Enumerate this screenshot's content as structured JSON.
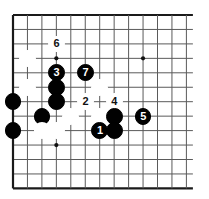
{
  "figure": {
    "kind": "go-board-diagram",
    "width": 209,
    "height": 199,
    "background_color": "#ffffff"
  },
  "board": {
    "columns": 13,
    "rows": 13,
    "origin_x": 13,
    "origin_y": 15,
    "spacing": 14.45,
    "line_color": "#5a5a5a",
    "edge_color": "#1a1a1a",
    "line_width": 1,
    "edge_width": 2.2,
    "star_point_color": "#111111",
    "star_point_radius": 2.1,
    "star_points": [
      {
        "col": 3,
        "row": 3
      },
      {
        "col": 9,
        "row": 3
      },
      {
        "col": 3,
        "row": 9
      }
    ]
  },
  "stones": {
    "radius": 8.4,
    "black_color": "#010101",
    "white_color": "#ffffff",
    "white_border_color": "#3a3a3a",
    "black_label_color": "#ffffff",
    "white_label_color": "#111111",
    "list": [
      {
        "id": "w-a",
        "color": "white",
        "col": 1,
        "row": 3,
        "label": ""
      },
      {
        "id": "w-move-6",
        "color": "white",
        "col": 3,
        "row": 2,
        "label": "6"
      },
      {
        "id": "b-move-3",
        "color": "black",
        "col": 3,
        "row": 4,
        "label": "3"
      },
      {
        "id": "b-move-7",
        "color": "black",
        "col": 5,
        "row": 4,
        "label": "7"
      },
      {
        "id": "w-b",
        "color": "white",
        "col": 1,
        "row": 5,
        "label": ""
      },
      {
        "id": "b-c",
        "color": "black",
        "col": 3,
        "row": 5,
        "label": ""
      },
      {
        "id": "w-c",
        "color": "white",
        "col": 6,
        "row": 5,
        "label": ""
      },
      {
        "id": "b-d",
        "color": "black",
        "col": 0,
        "row": 6,
        "label": ""
      },
      {
        "id": "b-e",
        "color": "black",
        "col": 3,
        "row": 6,
        "label": ""
      },
      {
        "id": "w-move-2",
        "color": "white",
        "col": 5,
        "row": 6,
        "label": "2"
      },
      {
        "id": "w-move-4",
        "color": "white",
        "col": 7,
        "row": 6,
        "label": "4"
      },
      {
        "id": "b-f",
        "color": "black",
        "col": 2,
        "row": 7,
        "label": ""
      },
      {
        "id": "w-d",
        "color": "white",
        "col": 4,
        "row": 7,
        "label": ""
      },
      {
        "id": "w-e",
        "color": "white",
        "col": 6,
        "row": 7,
        "label": ""
      },
      {
        "id": "b-g",
        "color": "black",
        "col": 7,
        "row": 7,
        "label": ""
      },
      {
        "id": "b-move-5",
        "color": "black",
        "col": 9,
        "row": 7,
        "label": "5"
      },
      {
        "id": "b-h",
        "color": "black",
        "col": 0,
        "row": 8,
        "label": ""
      },
      {
        "id": "w-f",
        "color": "white",
        "col": 2,
        "row": 8,
        "label": ""
      },
      {
        "id": "w-g",
        "color": "white",
        "col": 3,
        "row": 8,
        "label": ""
      },
      {
        "id": "b-move-1",
        "color": "black",
        "col": 6,
        "row": 8,
        "label": "1"
      },
      {
        "id": "b-i",
        "color": "black",
        "col": 7,
        "row": 8,
        "label": ""
      }
    ]
  },
  "move_sequence": [
    {
      "number": "1",
      "color": "black"
    },
    {
      "number": "2",
      "color": "white"
    },
    {
      "number": "3",
      "color": "black"
    },
    {
      "number": "4",
      "color": "white"
    },
    {
      "number": "5",
      "color": "black"
    },
    {
      "number": "6",
      "color": "white"
    },
    {
      "number": "7",
      "color": "black"
    }
  ]
}
